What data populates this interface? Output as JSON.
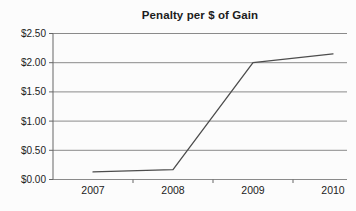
{
  "chart_data": {
    "type": "line",
    "title": "Penalty per $ of Gain",
    "categories": [
      "2007",
      "2008",
      "2009",
      "2010"
    ],
    "values": [
      0.13,
      0.17,
      2.0,
      2.15
    ],
    "series": [
      {
        "name": "Penalty per $ of Gain",
        "values": [
          0.13,
          0.17,
          2.0,
          2.15
        ]
      }
    ],
    "xlabel": "",
    "ylabel": "",
    "ylim": [
      0,
      2.5
    ],
    "ytick_step": 0.5,
    "ytick_labels": [
      "$0.00",
      "$0.50",
      "$1.00",
      "$1.50",
      "$2.00",
      "$2.50"
    ],
    "grid": "horizontal",
    "legend_position": "none",
    "colors": {
      "line": "#4d4d4d",
      "gridline": "#8a8a8a",
      "axis": "#666666",
      "text": "#222222",
      "title": "#1c1c1c",
      "background": "#fcfcfc"
    }
  }
}
